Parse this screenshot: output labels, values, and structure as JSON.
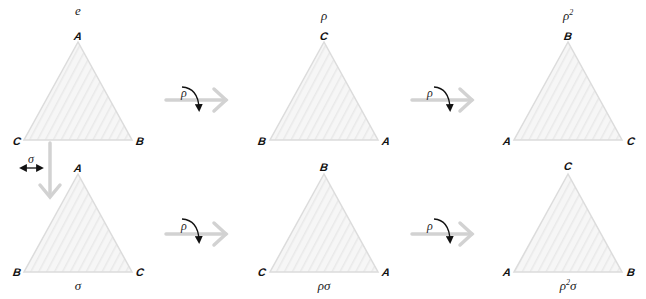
{
  "diagram": {
    "colors": {
      "triangle_fill": "#f4f4f4",
      "triangle_stroke": "#dcdcdc",
      "hatch": "#ebebeb",
      "transition_arrow": "#d4d4d4",
      "rotation_arrow": "#111111",
      "label": "#111111"
    },
    "triangles": [
      {
        "id": "e",
        "caption": "e",
        "caption_pos": "top",
        "apex": "A",
        "left": "C",
        "right": "B"
      },
      {
        "id": "rho",
        "caption": "ρ",
        "caption_pos": "top",
        "apex": "C",
        "left": "B",
        "right": "A"
      },
      {
        "id": "rho2",
        "caption": "ρ",
        "caption_sup": "2",
        "caption_pos": "top",
        "apex": "B",
        "left": "A",
        "right": "C"
      },
      {
        "id": "sigma",
        "caption": "σ",
        "caption_pos": "bottom",
        "apex": "A",
        "left": "B",
        "right": "C"
      },
      {
        "id": "rho-sigma",
        "caption": "ρσ",
        "caption_pos": "bottom",
        "apex": "B",
        "left": "C",
        "right": "A"
      },
      {
        "id": "rho2-sigma",
        "caption": "ρ",
        "caption_sup": "2",
        "caption_tail": "σ",
        "caption_pos": "bottom",
        "apex": "C",
        "left": "A",
        "right": "B"
      }
    ],
    "operations": [
      {
        "id": "top-1",
        "symbol": "ρ",
        "icon": "rotation-clockwise-icon"
      },
      {
        "id": "top-2",
        "symbol": "ρ",
        "icon": "rotation-clockwise-icon"
      },
      {
        "id": "bottom-1",
        "symbol": "ρ",
        "icon": "rotation-clockwise-icon"
      },
      {
        "id": "bottom-2",
        "symbol": "ρ",
        "icon": "rotation-clockwise-icon"
      },
      {
        "id": "reflect",
        "symbol": "σ",
        "icon": "reflection-double-arrow-icon"
      }
    ]
  }
}
